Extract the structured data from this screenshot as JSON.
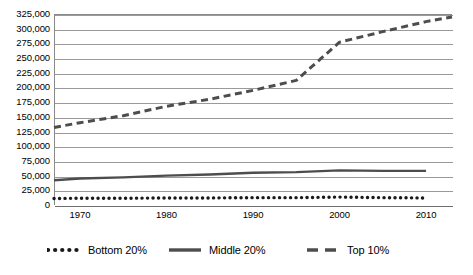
{
  "chart_data": {
    "type": "line",
    "title": "",
    "subtitle": "",
    "xlabel": "",
    "ylabel": "",
    "grid": "horizontal",
    "legend_position": "bottom",
    "xlim": [
      1967,
      2013
    ],
    "ylim": [
      0,
      325000
    ],
    "ytick_step": 25000,
    "x_ticks": [
      1970,
      1980,
      1990,
      2000,
      2010
    ],
    "x_tick_labels": [
      "1970",
      "1980",
      "1990",
      "2000",
      "2010"
    ],
    "y_tick_labels": [
      "0",
      "25,000",
      "50,000",
      "75,000",
      "100,000",
      "125,000",
      "150,000",
      "175,000",
      "200,000",
      "225,000",
      "250,000",
      "275,000",
      "300,000",
      "325,000"
    ],
    "y_tick_values": [
      0,
      25000,
      50000,
      75000,
      100000,
      125000,
      150000,
      175000,
      200000,
      225000,
      250000,
      275000,
      300000,
      325000
    ],
    "series": [
      {
        "name": "Bottom 20%",
        "style": "dotted",
        "color": "#1a1a1a",
        "x": [
          1967,
          1970,
          1975,
          1980,
          1985,
          1990,
          1995,
          2000,
          2005,
          2010
        ],
        "values": [
          11000,
          11500,
          11500,
          12000,
          12000,
          12500,
          12500,
          13500,
          12500,
          12000
        ]
      },
      {
        "name": "Middle 20%",
        "style": "solid",
        "color": "#4d4d4d",
        "x": [
          1967,
          1970,
          1975,
          1980,
          1985,
          1990,
          1995,
          2000,
          2005,
          2010
        ],
        "values": [
          42000,
          45000,
          47000,
          50000,
          52000,
          55000,
          56000,
          59000,
          58000,
          58000
        ]
      },
      {
        "name": "Top 10%",
        "style": "dashed",
        "color": "#4d4d4d",
        "x": [
          1967,
          1970,
          1975,
          1980,
          1985,
          1990,
          1995,
          2000,
          2005,
          2010,
          2013
        ],
        "values": [
          132000,
          140000,
          152000,
          168000,
          180000,
          195000,
          212000,
          277000,
          295000,
          312000,
          320000
        ]
      }
    ],
    "legend": [
      {
        "label": "Bottom 20%",
        "style": "dotted",
        "color": "#1a1a1a"
      },
      {
        "label": "Middle 20%",
        "style": "solid",
        "color": "#4d4d4d"
      },
      {
        "label": "Top 10%",
        "style": "dashed",
        "color": "#4d4d4d"
      }
    ]
  }
}
